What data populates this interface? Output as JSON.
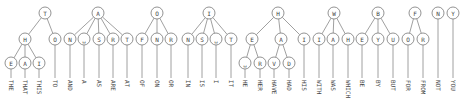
{
  "levels_y": [
    13,
    39,
    63
  ],
  "leaf_line_bottom": 78,
  "word_y": 80,
  "nodes": [
    {
      "id": "T",
      "label": "T",
      "x": 45,
      "y": 13
    },
    {
      "id": "TH",
      "label": "H",
      "x": 25,
      "y": 39,
      "parent": "T"
    },
    {
      "id": "THE",
      "label": "E",
      "x": 11,
      "y": 63,
      "parent": "TH",
      "word": "THE"
    },
    {
      "id": "THA",
      "label": "A",
      "x": 25,
      "y": 63,
      "parent": "TH",
      "word": "THAT"
    },
    {
      "id": "THI",
      "label": "I",
      "x": 39,
      "y": 63,
      "parent": "TH",
      "word": "THIS"
    },
    {
      "id": "TO",
      "label": "O",
      "x": 55,
      "y": 39,
      "parent": "T",
      "word": "TO"
    },
    {
      "id": "A",
      "label": "A",
      "x": 98,
      "y": 13
    },
    {
      "id": "AN",
      "label": "N",
      "x": 70,
      "y": 39,
      "parent": "A",
      "word": "AND"
    },
    {
      "id": "A_",
      "label": "␣",
      "x": 84,
      "y": 39,
      "parent": "A",
      "word": "A"
    },
    {
      "id": "AS",
      "label": "S",
      "x": 99,
      "y": 39,
      "parent": "A",
      "word": "AS"
    },
    {
      "id": "AR",
      "label": "R",
      "x": 113,
      "y": 39,
      "parent": "A",
      "word": "ARE"
    },
    {
      "id": "AT",
      "label": "T",
      "x": 127,
      "y": 39,
      "parent": "A",
      "word": "AT"
    },
    {
      "id": "O",
      "label": "O",
      "x": 157,
      "y": 13
    },
    {
      "id": "OF",
      "label": "F",
      "x": 142,
      "y": 39,
      "parent": "O",
      "word": "OF"
    },
    {
      "id": "ON",
      "label": "N",
      "x": 157,
      "y": 39,
      "parent": "O",
      "word": "ON"
    },
    {
      "id": "OR",
      "label": "R",
      "x": 171,
      "y": 39,
      "parent": "O",
      "word": "OR"
    },
    {
      "id": "I",
      "label": "I",
      "x": 209,
      "y": 13
    },
    {
      "id": "IN",
      "label": "N",
      "x": 188,
      "y": 39,
      "parent": "I",
      "word": "IN"
    },
    {
      "id": "IS",
      "label": "S",
      "x": 202,
      "y": 39,
      "parent": "I",
      "word": "IS"
    },
    {
      "id": "I_",
      "label": "␣",
      "x": 216,
      "y": 39,
      "parent": "I",
      "word": "I"
    },
    {
      "id": "IT",
      "label": "T",
      "x": 231,
      "y": 39,
      "parent": "I",
      "word": "IT"
    },
    {
      "id": "H",
      "label": "H",
      "x": 278,
      "y": 13
    },
    {
      "id": "HE",
      "label": "E",
      "x": 252,
      "y": 39,
      "parent": "H"
    },
    {
      "id": "HE_",
      "label": "␣",
      "x": 245,
      "y": 63,
      "parent": "HE",
      "word": "HE"
    },
    {
      "id": "HER",
      "label": "R",
      "x": 260,
      "y": 63,
      "parent": "HE",
      "word": "HER"
    },
    {
      "id": "HA",
      "label": "A",
      "x": 281,
      "y": 39,
      "parent": "H"
    },
    {
      "id": "HAV",
      "label": "V",
      "x": 274,
      "y": 63,
      "parent": "HA",
      "word": "HAVE"
    },
    {
      "id": "HAD",
      "label": "D",
      "x": 289,
      "y": 63,
      "parent": "HA",
      "word": "HAD"
    },
    {
      "id": "HI",
      "label": "I",
      "x": 304,
      "y": 39,
      "parent": "H",
      "word": "HIS"
    },
    {
      "id": "W",
      "label": "W",
      "x": 334,
      "y": 13
    },
    {
      "id": "WI",
      "label": "I",
      "x": 319,
      "y": 39,
      "parent": "W",
      "word": "WITH"
    },
    {
      "id": "WA",
      "label": "A",
      "x": 333,
      "y": 39,
      "parent": "W",
      "word": "WAS"
    },
    {
      "id": "WH",
      "label": "H",
      "x": 348,
      "y": 39,
      "parent": "W",
      "word": "WHICH"
    },
    {
      "id": "B",
      "label": "B",
      "x": 378,
      "y": 13
    },
    {
      "id": "BE",
      "label": "E",
      "x": 362,
      "y": 39,
      "parent": "B",
      "word": "BE"
    },
    {
      "id": "BY",
      "label": "Y",
      "x": 378,
      "y": 39,
      "parent": "B",
      "word": "BY"
    },
    {
      "id": "BU",
      "label": "U",
      "x": 393,
      "y": 39,
      "parent": "B",
      "word": "BUT"
    },
    {
      "id": "F",
      "label": "F",
      "x": 415,
      "y": 13
    },
    {
      "id": "FO",
      "label": "O",
      "x": 408,
      "y": 39,
      "parent": "F",
      "word": "FOR"
    },
    {
      "id": "FR",
      "label": "R",
      "x": 423,
      "y": 39,
      "parent": "F",
      "word": "FROM"
    },
    {
      "id": "N",
      "label": "N",
      "x": 438,
      "y": 13,
      "word": "NOT"
    },
    {
      "id": "Y",
      "label": "Y",
      "x": 453,
      "y": 13,
      "word": "YOU"
    }
  ]
}
